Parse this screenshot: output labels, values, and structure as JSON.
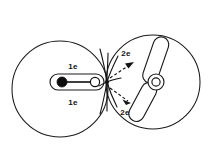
{
  "figure": {
    "background_color": "#ffffff",
    "stroke_color": "#1a1a1a",
    "width": 214,
    "height": 155
  },
  "left_region": {
    "name": "left-circle",
    "shape": "circle",
    "center_x": 60,
    "center_y": 89,
    "radius": 48
  },
  "right_region": {
    "name": "right-circle",
    "shape": "circle",
    "center_x": 153,
    "center_y": 82,
    "radius": 47
  },
  "left_object": {
    "name": "capsule-rod",
    "description": "horizontal rounded capsule containing a filled node and an open node joined by a rod",
    "filled_node_label": "",
    "open_node_label": ""
  },
  "labels": {
    "left_top": "1e",
    "left_bottom": "1e",
    "right_top": "2e",
    "right_bottom": "2e"
  },
  "collision": {
    "name": "impact-burst",
    "x": 107,
    "y": 82,
    "ray_count": 8
  },
  "arrows": {
    "upper": {
      "label": "2e",
      "direction": "up-right",
      "style": "dashed"
    },
    "lower": {
      "label": "2e",
      "direction": "down-right",
      "style": "dashed"
    }
  },
  "right_object": {
    "name": "bent-rotor",
    "description": "two angled capsule arms joined at a ring hub forming a bent propeller",
    "hub_outer_radius": 8,
    "hub_inner_radius": 4
  }
}
